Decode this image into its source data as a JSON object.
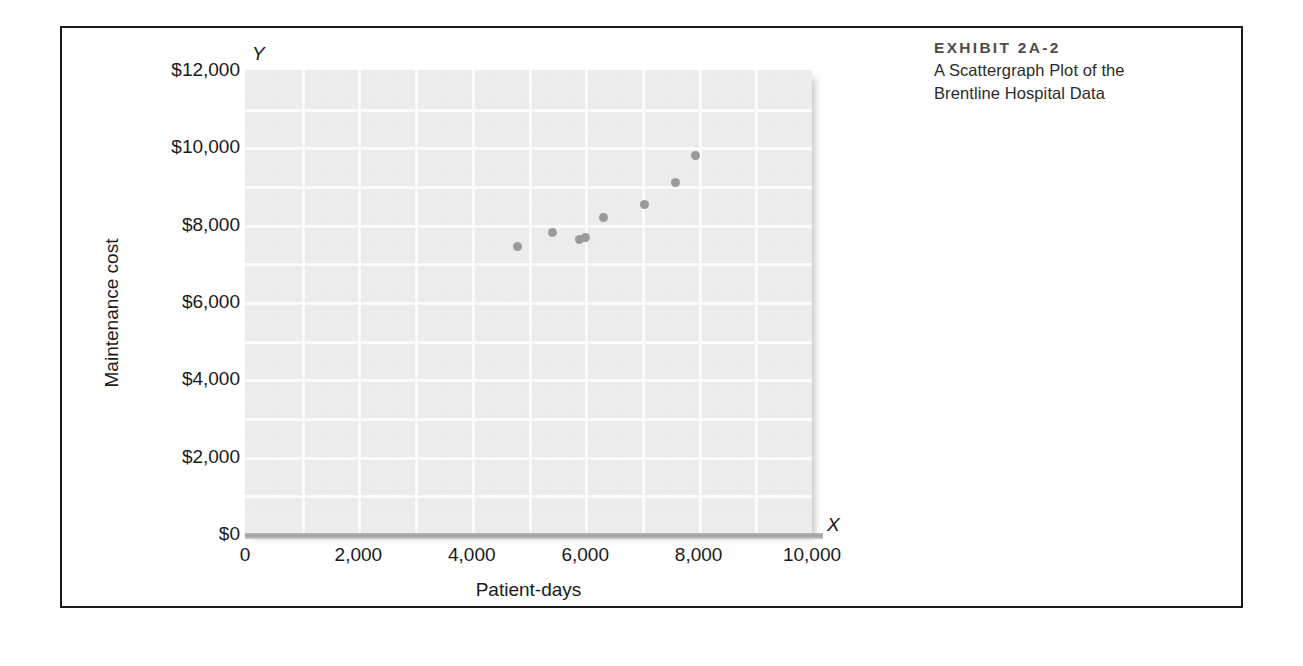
{
  "caption": {
    "kicker": "EXHIBIT 2A-2",
    "line1": "A Scattergraph Plot of the",
    "line2": "Brentline Hospital Data"
  },
  "axis_markers": {
    "y_letter": "Y",
    "x_letter": "X"
  },
  "colors": {
    "frame": "#1a1a1a",
    "plot_background": "#e9e9e9",
    "gridline": "#fbfbfb",
    "datapoint": "#9a9a9a",
    "axis_line": "#a0a0a0",
    "caption_kicker": "#4c4c4c",
    "caption_text": "#2b2b2b",
    "tick_text": "#1a1a1a"
  },
  "chart_data": {
    "type": "scatter",
    "title": "A Scattergraph Plot of the Brentline Hospital Data",
    "xlabel": "Patient-days",
    "ylabel": "Maintenance cost",
    "xlim": [
      0,
      10000
    ],
    "ylim": [
      0,
      12000
    ],
    "grid": true,
    "legend": null,
    "xticks": [
      0,
      2000,
      4000,
      6000,
      8000,
      10000
    ],
    "xticklabels": [
      "0",
      "2,000",
      "4,000",
      "6,000",
      "8,000",
      "10,000"
    ],
    "yticks": [
      0,
      2000,
      4000,
      6000,
      8000,
      10000,
      12000
    ],
    "yticklabels": [
      "$0",
      "$2,000",
      "$4,000",
      "$6,000",
      "$8,000",
      "$10,000",
      "$12,000"
    ],
    "x_minor_step": 1000,
    "y_minor_step": 1000,
    "series": [
      {
        "name": "Brentline Hospital monthly observations",
        "points": [
          {
            "x": 4800,
            "y": 7430
          },
          {
            "x": 5430,
            "y": 7790
          },
          {
            "x": 6000,
            "y": 7660
          },
          {
            "x": 6330,
            "y": 8180
          },
          {
            "x": 7050,
            "y": 8510
          },
          {
            "x": 7600,
            "y": 9100
          },
          {
            "x": 7940,
            "y": 9780
          },
          {
            "x": 5900,
            "y": 7620
          }
        ]
      }
    ]
  }
}
